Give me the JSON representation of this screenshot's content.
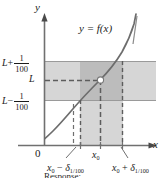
{
  "figure": {
    "caption": "Response:",
    "axes": {
      "x_label": "x",
      "y_label": "y",
      "origin_label": "0"
    },
    "curve_label": "y = f(x)",
    "y_ticks": [
      {
        "id": "L-plus",
        "base": "L",
        "op": "+",
        "num": "1",
        "den": "100"
      },
      {
        "id": "L",
        "base": "L",
        "op": "",
        "num": "",
        "den": ""
      },
      {
        "id": "L-minus",
        "base": "L",
        "op": "−",
        "num": "1",
        "den": "100"
      }
    ],
    "x_ticks": [
      {
        "id": "x0-minus-delta",
        "base": "x",
        "basesub": "0",
        "op": "−",
        "sym": "δ",
        "symsub": "1/100"
      },
      {
        "id": "x0",
        "base": "x",
        "basesub": "0",
        "op": "",
        "sym": "",
        "symsub": ""
      },
      {
        "id": "x0-plus-delta",
        "base": "x",
        "basesub": "0",
        "op": "+",
        "sym": "δ",
        "symsub": "1/100"
      }
    ],
    "colors": {
      "ink": "#1b1b1b",
      "axis": "#7b7b7b",
      "curve": "#6d6d6d",
      "band_light": "#d4d4d4",
      "band_dark": "#b9b9b9",
      "dashed": "#6f6f6f",
      "point_fill": "#ffffff"
    },
    "geometry": {
      "y_axis_x": 44,
      "x_axis_y": 145,
      "band_top_y": 61,
      "band_L_y": 80,
      "band_bottom_y": 100,
      "band_right_x": 156,
      "strip_left_x": 80,
      "strip_x0_x": 100,
      "strip_right_x": 123,
      "dash_left_x": 73,
      "point_x": 100,
      "point_y": 80
    }
  }
}
